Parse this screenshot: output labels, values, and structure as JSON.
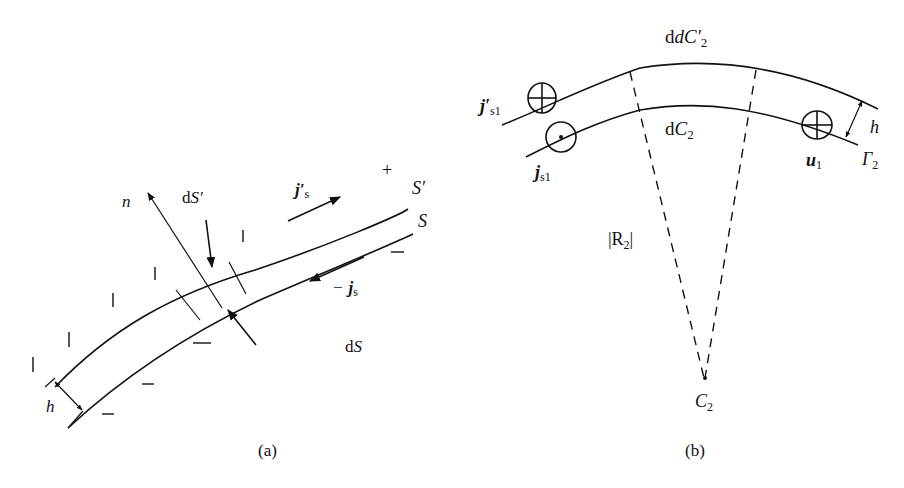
{
  "figure_a": {
    "caption": "(a)",
    "labels": {
      "normal": "n",
      "dS_prime": "dS′",
      "dS": "dS",
      "js_prime": "j′",
      "js_prime_sub": "s",
      "minus_js_sign": "−",
      "js": "j",
      "js_sub": "s",
      "surface_outer": "S′",
      "surface_inner": "S",
      "plus_sign": "+",
      "thickness": "h"
    },
    "charge_marks": {
      "outer_side": "|",
      "inner_side": "−"
    }
  },
  "figure_b": {
    "caption": "(b)",
    "labels": {
      "dC2_prime": "dC′",
      "dC2_prime_sub": "2",
      "dC2": "dC",
      "dC2_sub": "2",
      "js1_prime": "j′",
      "js1_prime_sub": "s1",
      "js1": "j",
      "js1_sub": "s1",
      "u1": "u",
      "u1_sub": "1",
      "gamma2": "Γ",
      "gamma2_sub": "2",
      "thickness": "h",
      "radius": "|R",
      "radius_sub": "2",
      "radius_close": "|",
      "center": "C",
      "center_sub": "2"
    }
  }
}
